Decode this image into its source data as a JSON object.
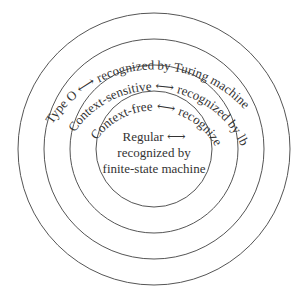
{
  "diagram": {
    "center": {
      "x": 154,
      "y": 149
    },
    "rings": [
      {
        "id": "type0",
        "radius": 136,
        "language": "Type O",
        "recognizer": "recognized by Turing machine"
      },
      {
        "id": "context-sensitive",
        "radius": 110,
        "language": "Context-sensitive",
        "recognizer": "recognized by lba"
      },
      {
        "id": "context-free",
        "radius": 84,
        "language": "Context-free",
        "recognizer": "recognized by pda"
      },
      {
        "id": "regular",
        "radius": 58,
        "language": "Regular",
        "recognizer_line1": "recognized by",
        "recognizer_line2": "finite-state machine"
      }
    ],
    "arrow_symbol": "double-headed-arrow",
    "stroke_color": "#555555",
    "text_color": "#333333"
  }
}
